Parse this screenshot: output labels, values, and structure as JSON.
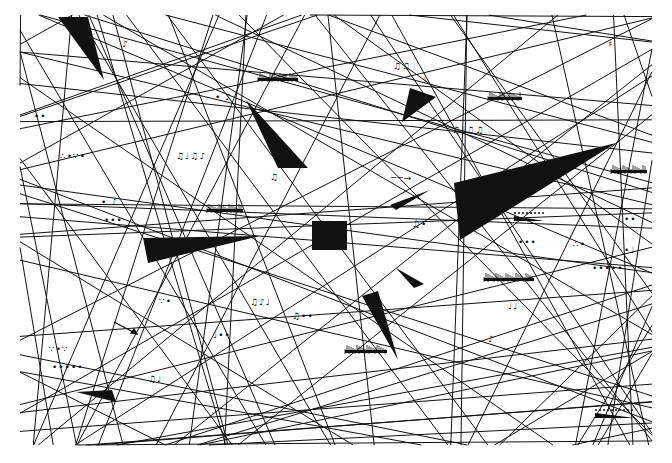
{
  "artwork": {
    "width": 672,
    "height": 463,
    "background": "#ffffff",
    "ink": "#111111",
    "central_square": {
      "x": 312,
      "y": 221,
      "w": 35,
      "h": 29
    },
    "wedges": [
      {
        "name": "top-left-wedge",
        "points": "58,17 88,17 104,80"
      },
      {
        "name": "upper-center-wedge",
        "points": "246,100 308,168 278,168"
      },
      {
        "name": "upper-right-small-wedge",
        "points": "410,88 436,97 402,122"
      },
      {
        "name": "large-right-triangle",
        "points": "454,183 616,143 460,240"
      },
      {
        "name": "mid-connector-wedge",
        "points": "390,205 430,190 396,210"
      },
      {
        "name": "left-horizontal-wedge",
        "points": "143,238 260,236 148,263"
      },
      {
        "name": "center-lower-wedge",
        "points": "362,296 378,291 398,360"
      },
      {
        "name": "center-lower-small-wedge",
        "points": "396,268 424,284 414,288"
      },
      {
        "name": "bottom-left-wedge",
        "points": "76,392 112,390 116,402"
      }
    ],
    "fragments": [
      {
        "glyph": "♪",
        "x": 122,
        "y": 40
      },
      {
        "glyph": "♫♫",
        "x": 393,
        "y": 62
      },
      {
        "glyph": "♩",
        "x": 422,
        "y": 76
      },
      {
        "glyph": "♯",
        "x": 608,
        "y": 40
      },
      {
        "glyph": "••",
        "x": 34,
        "y": 112
      },
      {
        "glyph": "• ♪",
        "x": 215,
        "y": 93
      },
      {
        "glyph": "∴•∵•",
        "x": 60,
        "y": 152
      },
      {
        "glyph": "♫♩♫♪",
        "x": 176,
        "y": 152
      },
      {
        "glyph": "♫♩♫♫",
        "x": 452,
        "y": 126
      },
      {
        "glyph": "♫",
        "x": 270,
        "y": 173
      },
      {
        "glyph": "──→",
        "x": 391,
        "y": 174
      },
      {
        "glyph": "♫•",
        "x": 412,
        "y": 220
      },
      {
        "glyph": "• ♪",
        "x": 101,
        "y": 198
      },
      {
        "glyph": "•••",
        "x": 104,
        "y": 216
      },
      {
        "glyph": "∵•",
        "x": 159,
        "y": 297
      },
      {
        "glyph": "♫♪♩",
        "x": 250,
        "y": 298
      },
      {
        "glyph": "♫••",
        "x": 292,
        "y": 312
      },
      {
        "glyph": "♩••",
        "x": 213,
        "y": 331
      },
      {
        "glyph": "∵•∵",
        "x": 49,
        "y": 345
      },
      {
        "glyph": "•••••",
        "x": 52,
        "y": 363
      },
      {
        "glyph": "♫♩",
        "x": 148,
        "y": 375
      },
      {
        "glyph": "•••",
        "x": 518,
        "y": 238
      },
      {
        "glyph": "∴•",
        "x": 573,
        "y": 240
      },
      {
        "glyph": "•♩",
        "x": 624,
        "y": 246
      },
      {
        "glyph": "•••••",
        "x": 592,
        "y": 264
      },
      {
        "glyph": "♩♩",
        "x": 508,
        "y": 302
      },
      {
        "glyph": "♪",
        "x": 488,
        "y": 335
      },
      {
        "glyph": "••",
        "x": 624,
        "y": 215
      }
    ],
    "tremolo_clusters": [
      {
        "x": 258,
        "y": 76,
        "w": 40
      },
      {
        "x": 488,
        "y": 95,
        "w": 34
      },
      {
        "x": 207,
        "y": 207,
        "w": 36
      },
      {
        "x": 611,
        "y": 168,
        "w": 36
      },
      {
        "x": 484,
        "y": 276,
        "w": 50
      },
      {
        "x": 345,
        "y": 348,
        "w": 42
      }
    ],
    "hairpins": [
      {
        "x": 514,
        "y": 213,
        "w": 30
      },
      {
        "x": 595,
        "y": 410,
        "w": 40
      }
    ],
    "arrows": [
      {
        "x1": 114,
        "y1": 322,
        "x2": 137,
        "y2": 334
      }
    ]
  }
}
